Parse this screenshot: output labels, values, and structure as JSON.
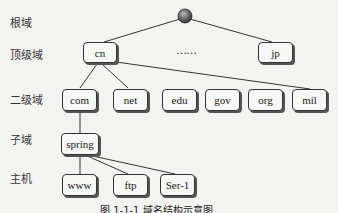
{
  "levels": {
    "root": "根域",
    "tld": "顶级域",
    "sld": "二级域",
    "subdomain": "子域",
    "host": "主机"
  },
  "tld_nodes": [
    "cn",
    "jp"
  ],
  "ellipsis": "……",
  "sld_nodes": [
    "com",
    "net",
    "edu",
    "gov",
    "org",
    "mil"
  ],
  "subdomain_nodes": [
    "spring"
  ],
  "host_nodes": [
    "www",
    "ftp",
    "Ser-1"
  ],
  "caption": "图 1-1-1 域名结构示意图",
  "colors": {
    "line": "#333333",
    "box_bg": "#f7f7f5",
    "root": "#555555"
  }
}
